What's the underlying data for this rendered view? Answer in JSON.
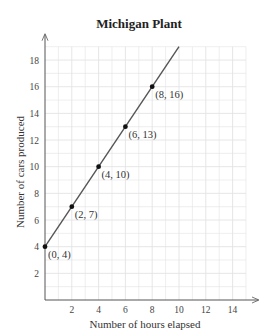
{
  "chart_data": {
    "type": "line",
    "title": "Michigan Plant",
    "xlabel": "Number of hours elapsed",
    "ylabel": "Number of cars produced",
    "xlim": [
      0,
      15
    ],
    "ylim": [
      0,
      19
    ],
    "x_ticks": [
      2,
      4,
      6,
      8,
      10,
      12,
      14
    ],
    "y_ticks": [
      2,
      4,
      6,
      8,
      10,
      12,
      14,
      16,
      18
    ],
    "grid": true,
    "legend": null,
    "series": [
      {
        "name": "Michigan Plant",
        "x": [
          0,
          2,
          4,
          6,
          8
        ],
        "y": [
          4,
          7,
          10,
          13,
          16
        ],
        "line_extends_to": [
          10,
          19
        ]
      }
    ],
    "annotations": [
      "(0, 4)",
      "(2, 7)",
      "(4, 10)",
      "(6, 13)",
      "(8, 16)"
    ]
  },
  "colors": {
    "grid": "#e3e3e3",
    "axis": "#555555",
    "line": "#555555",
    "point": "#111111"
  }
}
